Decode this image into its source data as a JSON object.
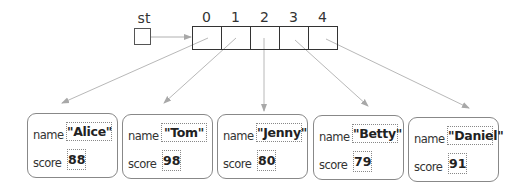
{
  "diagram": {
    "pointer": {
      "label": "st"
    },
    "array": {
      "indices": [
        "0",
        "1",
        "2",
        "3",
        "4"
      ]
    },
    "field_labels": {
      "name": "name",
      "score": "score"
    },
    "records": [
      {
        "name": "\"Alice\"",
        "score": "88"
      },
      {
        "name": "\"Tom\"",
        "score": "98"
      },
      {
        "name": "\"Jenny\"",
        "score": "80"
      },
      {
        "name": "\"Betty\"",
        "score": "79"
      },
      {
        "name": "\"Daniel\"",
        "score": "91"
      }
    ],
    "colors": {
      "arrow": "#b0b0b0",
      "border": "#333333",
      "record_border": "#888888"
    }
  }
}
